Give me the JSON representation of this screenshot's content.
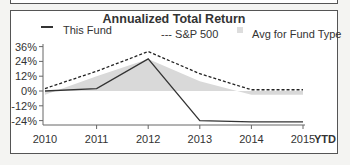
{
  "chart_data": {
    "type": "line",
    "title": "Annualized Total Return",
    "categories": [
      "2010",
      "2011",
      "2012",
      "2013",
      "2014",
      "2015"
    ],
    "x_suffix_label": "YTD",
    "series": [
      {
        "name": "This Fund",
        "style": "solid",
        "color": "#333333",
        "values": [
          0,
          2,
          26,
          -24,
          -25,
          -25
        ]
      },
      {
        "name": "S&P 500",
        "style": "dashed",
        "color": "#222222",
        "values": [
          2,
          16,
          32,
          14,
          1,
          1
        ]
      },
      {
        "name": "Avg for Fund Type",
        "style": "area",
        "color": "#d9d9d9",
        "values": [
          -3,
          12,
          26,
          8,
          -3,
          -3
        ]
      }
    ],
    "yticks": [
      "36%",
      "24%",
      "12%",
      "0%",
      "-12%",
      "-24%"
    ],
    "ylim": [
      -30,
      40
    ],
    "xlabel": "",
    "ylabel": "",
    "grid": false,
    "legend_position": "top"
  },
  "legend": {
    "fund": "This Fund",
    "sp500": "--- S&P 500",
    "avg": "Avg for Fund Type"
  }
}
